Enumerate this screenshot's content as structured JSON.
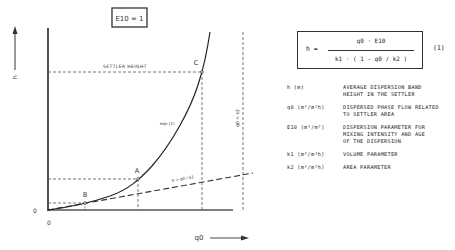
{
  "diagram": {
    "parameter_box": "E10 = 1",
    "y_axis_label": "h",
    "x_axis_label": "q0",
    "origin_y_label": "0",
    "origin_x_label": "0",
    "settler_height_label": "SETTLER HEIGHT",
    "curve_label": "eqn (1)",
    "line_label": "h = q0 / k1",
    "asymptote_label": "q0 = k2",
    "points": [
      {
        "label": "A"
      },
      {
        "label": "B"
      },
      {
        "label": "C"
      }
    ]
  },
  "formula": {
    "lhs": "h =",
    "numerator": "q0 · E10",
    "denominator": "k1 · ( 1 - q0 / k2 )",
    "equation_number": "(1)"
  },
  "legend": [
    {
      "symbol": "h (m)",
      "description": "AVERAGE DISPERSION BAND\nHEIGHT IN THE SETTLER"
    },
    {
      "symbol": "q0 (m³/m²h)",
      "description": "DISPERSED PHASE FLOW RELATED\nTO SETTLER AREA"
    },
    {
      "symbol": "E10 (m³/m²)",
      "description": "DISPERSION PARAMETER FOR\nMIXING INTENSITY AND AGE\nOF THE DISPERSION"
    },
    {
      "symbol": "k1 (m³/m³h)",
      "description": "VOLUME PARAMETER"
    },
    {
      "symbol": "k2 (m³/m²h)",
      "description": "AREA PARAMETER"
    }
  ]
}
